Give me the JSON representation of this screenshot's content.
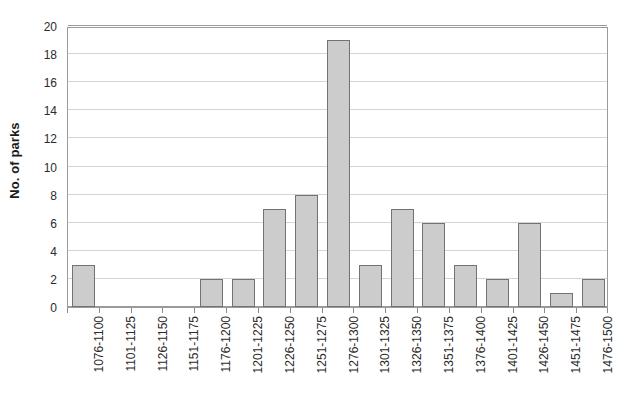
{
  "chart_data": {
    "type": "bar",
    "title": "",
    "subtitle": "",
    "xlabel": "",
    "ylabel": "No. of parks",
    "categories": [
      "1076-1100",
      "1101-1125",
      "1126-1150",
      "1151-1175",
      "1176-1200",
      "1201-1225",
      "1226-1250",
      "1251-1275",
      "1276-1300",
      "1301-1325",
      "1326-1350",
      "1351-1375",
      "1376-1400",
      "1401-1425",
      "1426-1450",
      "1451-1475",
      "1476-1500"
    ],
    "values": [
      3,
      0,
      0,
      0,
      2,
      2,
      7,
      8,
      19,
      3,
      7,
      6,
      3,
      2,
      6,
      1,
      2
    ],
    "ylim": [
      0,
      20
    ],
    "ytick_step": 2,
    "yticks": [
      0,
      2,
      4,
      6,
      8,
      10,
      12,
      14,
      16,
      18,
      20
    ],
    "ytick_labels": [
      "0",
      "2",
      "4",
      "6",
      "8",
      "10",
      "12",
      "14",
      "16",
      "18",
      "20"
    ],
    "grid": true,
    "grid_axis": "y",
    "legend": false,
    "legend_position": "none",
    "xlabel_rotation": 90,
    "colors": {
      "bar_fill": "#cccccc",
      "bar_border": "#737373",
      "gridline": "#d4d4d4",
      "axis": "#9a9a9a",
      "text": "#2b2b2b",
      "title_text": "#1a1a1a",
      "plot_background": "#ffffff",
      "figure_background": "#ffffff"
    }
  }
}
